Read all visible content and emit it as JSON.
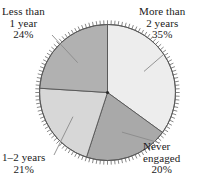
{
  "chart_data": {
    "type": "pie",
    "title": "",
    "subtitle": "",
    "xlabel": "",
    "ylabel": "",
    "legend_position": "none",
    "grid": false,
    "units": "percent",
    "categories": [
      "More than 2 years",
      "Never engaged",
      "1–2 years",
      "Less than 1 year"
    ],
    "values": [
      35,
      20,
      21,
      24
    ],
    "slices": [
      {
        "id": "more-than-2-years",
        "label_lines": [
          "More than",
          "2 years"
        ],
        "value_label": "35%",
        "value": 35,
        "color": "#ededed",
        "start_angle_deg": 0.0,
        "end_angle_deg": 126.0
      },
      {
        "id": "never-engaged",
        "label_lines": [
          "Never",
          "engaged"
        ],
        "value_label": "20%",
        "value": 20,
        "color": "#a9a9a9",
        "start_angle_deg": 126.0,
        "end_angle_deg": 198.0
      },
      {
        "id": "1-2-years",
        "label_lines": [
          "1–2 years"
        ],
        "value_label": "21%",
        "value": 21,
        "color": "#d7d7d7",
        "start_angle_deg": 198.0,
        "end_angle_deg": 273.6
      },
      {
        "id": "less-than-1-year",
        "label_lines": [
          "Less than",
          "1 year"
        ],
        "value_label": "24%",
        "value": 24,
        "color": "#b1b1b1",
        "start_angle_deg": 273.6,
        "end_angle_deg": 360.0
      }
    ],
    "total": 100,
    "style": {
      "outline_color": "#555555",
      "tick_color": "#6a6a6a",
      "leader_color": "#8a8a8a",
      "tick_count": 120,
      "background": "#ffffff"
    }
  }
}
